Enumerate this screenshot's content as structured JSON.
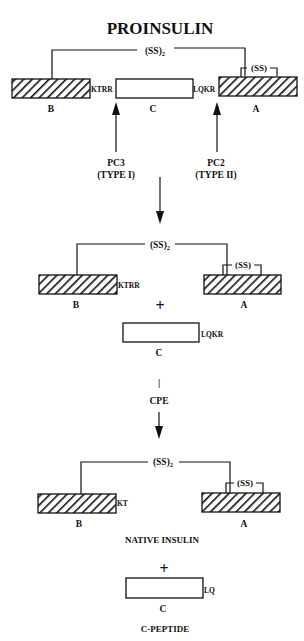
{
  "title": "PROINSULIN",
  "disulfide_inter": "(SS)",
  "disulfide_inter_sub": "2",
  "disulfide_intra": "(SS)",
  "chains": {
    "b": "B",
    "c": "C",
    "a": "A"
  },
  "proinsulin": {
    "bc_junction": "KTRR",
    "ca_junction": "LQKR"
  },
  "enzymes": {
    "pc3": {
      "name": "PC3",
      "type": "(TYPE I)"
    },
    "pc2": {
      "name": "PC2",
      "type": "(TYPE II)"
    }
  },
  "intermediate": {
    "b_tail": "KTRR",
    "plus": "+",
    "c_tail": "LQKR"
  },
  "cpe": {
    "separator": "|",
    "label": "CPE"
  },
  "product": {
    "b_tail": "KT",
    "label": "NATIVE INSULIN",
    "plus": "+",
    "c_tail": "LQ",
    "c_peptide_label": "C-PEPTIDE"
  },
  "colors": {
    "ink": "#111111",
    "background": "#ffffff"
  }
}
